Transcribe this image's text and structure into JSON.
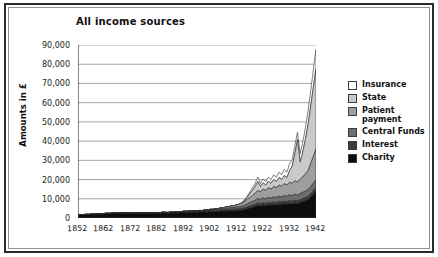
{
  "figure": {
    "title": "All income sources"
  },
  "legend": {
    "items": [
      {
        "label": "Insurance",
        "color": "#ffffff"
      },
      {
        "label": "State",
        "color": "#c9c9c9"
      },
      {
        "label": "Patient\npayment",
        "color": "#9e9e9e"
      },
      {
        "label": "Central Funds",
        "color": "#6e6e6e"
      },
      {
        "label": "Interest",
        "color": "#3d3d3d"
      },
      {
        "label": "Charity",
        "color": "#0d0d0d"
      }
    ]
  },
  "chart_data": {
    "type": "area",
    "stacked": true,
    "title": "All income sources",
    "xlabel": "",
    "ylabel": "Amounts in £",
    "xlim": [
      1852,
      1942
    ],
    "ylim": [
      0,
      90000
    ],
    "ytick_labels": [
      "90,000",
      "80,000",
      "70,000",
      "60,000",
      "50,000",
      "40,000",
      "30,000",
      "20,000",
      "10,000",
      "0"
    ],
    "ytick_values": [
      90000,
      80000,
      70000,
      60000,
      50000,
      40000,
      30000,
      20000,
      10000,
      0
    ],
    "xtick_labels": [
      "1852",
      "1862",
      "1872",
      "1882",
      "1892",
      "1902",
      "1912",
      "1922",
      "1932",
      "1942"
    ],
    "xtick_values": [
      1852,
      1862,
      1872,
      1882,
      1892,
      1902,
      1912,
      1922,
      1932,
      1942
    ],
    "grid": "horizontal",
    "legend_position": "right",
    "x": [
      1852,
      1853,
      1854,
      1855,
      1856,
      1857,
      1858,
      1859,
      1860,
      1861,
      1862,
      1863,
      1864,
      1865,
      1866,
      1867,
      1868,
      1869,
      1870,
      1871,
      1872,
      1873,
      1874,
      1875,
      1876,
      1877,
      1878,
      1879,
      1880,
      1881,
      1882,
      1883,
      1884,
      1885,
      1886,
      1887,
      1888,
      1889,
      1890,
      1891,
      1892,
      1893,
      1894,
      1895,
      1896,
      1897,
      1898,
      1899,
      1900,
      1901,
      1902,
      1903,
      1904,
      1905,
      1906,
      1907,
      1908,
      1909,
      1910,
      1911,
      1912,
      1913,
      1914,
      1915,
      1916,
      1917,
      1918,
      1919,
      1920,
      1921,
      1922,
      1923,
      1924,
      1925,
      1926,
      1927,
      1928,
      1929,
      1930,
      1931,
      1932,
      1933,
      1934,
      1935,
      1936,
      1937,
      1938,
      1939,
      1940,
      1941,
      1942
    ],
    "series": [
      {
        "name": "Charity",
        "color": "#0d0d0d",
        "values": [
          1500,
          1600,
          1550,
          1700,
          1650,
          1800,
          1750,
          1900,
          2000,
          1950,
          2100,
          2200,
          2150,
          2300,
          2250,
          2400,
          2350,
          2300,
          2400,
          2350,
          2300,
          2250,
          2400,
          2350,
          2300,
          2400,
          2350,
          2300,
          2450,
          2400,
          2500,
          2450,
          2600,
          2550,
          2500,
          2650,
          2600,
          2700,
          2650,
          2800,
          3000,
          2900,
          3000,
          2950,
          3100,
          3000,
          3200,
          3100,
          3300,
          3200,
          3400,
          3300,
          3500,
          3400,
          3600,
          3500,
          3800,
          3700,
          3900,
          3800,
          4000,
          3900,
          4200,
          4400,
          4800,
          5200,
          5600,
          6000,
          6600,
          6200,
          6800,
          6400,
          6900,
          6600,
          7000,
          6800,
          7200,
          7000,
          7400,
          7100,
          7600,
          7300,
          7800,
          7500,
          8000,
          8500,
          9000,
          9500,
          11000,
          12500,
          14000
        ]
      },
      {
        "name": "Interest",
        "color": "#3d3d3d",
        "values": [
          200,
          210,
          220,
          215,
          230,
          225,
          240,
          250,
          245,
          260,
          270,
          265,
          280,
          275,
          290,
          300,
          295,
          310,
          305,
          320,
          315,
          330,
          325,
          340,
          335,
          350,
          345,
          360,
          355,
          370,
          380,
          375,
          390,
          400,
          395,
          410,
          420,
          415,
          430,
          440,
          450,
          460,
          470,
          480,
          490,
          500,
          510,
          520,
          530,
          540,
          560,
          570,
          580,
          600,
          620,
          640,
          660,
          680,
          700,
          720,
          750,
          780,
          800,
          850,
          900,
          950,
          1000,
          1050,
          1100,
          1080,
          1150,
          1120,
          1200,
          1180,
          1250,
          1220,
          1300,
          1280,
          1350,
          1320,
          1400,
          1380,
          1450,
          1420,
          1500,
          1550,
          1600,
          1650,
          1700,
          1750,
          1800
        ]
      },
      {
        "name": "Central Funds",
        "color": "#6e6e6e",
        "values": [
          0,
          0,
          0,
          0,
          0,
          0,
          0,
          0,
          0,
          0,
          0,
          0,
          0,
          0,
          0,
          0,
          0,
          0,
          0,
          0,
          0,
          0,
          0,
          0,
          0,
          0,
          0,
          0,
          0,
          0,
          0,
          0,
          0,
          0,
          0,
          0,
          0,
          0,
          0,
          0,
          100,
          120,
          140,
          160,
          180,
          200,
          230,
          260,
          300,
          340,
          380,
          420,
          470,
          520,
          580,
          640,
          700,
          760,
          820,
          900,
          1000,
          1100,
          1200,
          1400,
          1600,
          1800,
          2000,
          2200,
          2400,
          2300,
          2500,
          2400,
          2600,
          2500,
          2700,
          2600,
          2800,
          2700,
          2900,
          2800,
          3000,
          2900,
          3100,
          3000,
          3200,
          3300,
          3400,
          3500,
          3600,
          3800,
          4000
        ]
      },
      {
        "name": "Patient payment",
        "color": "#9e9e9e",
        "values": [
          0,
          0,
          0,
          0,
          0,
          0,
          0,
          0,
          0,
          0,
          0,
          0,
          0,
          0,
          0,
          0,
          0,
          0,
          0,
          0,
          0,
          0,
          0,
          0,
          0,
          0,
          0,
          0,
          0,
          0,
          0,
          0,
          0,
          0,
          0,
          0,
          0,
          0,
          0,
          0,
          0,
          0,
          0,
          0,
          0,
          0,
          0,
          0,
          100,
          150,
          200,
          250,
          320,
          400,
          480,
          560,
          660,
          760,
          880,
          1000,
          1200,
          1400,
          1600,
          1900,
          2300,
          2700,
          3100,
          3600,
          4200,
          4000,
          4600,
          4400,
          5000,
          4800,
          5400,
          5200,
          5800,
          5600,
          6200,
          6000,
          6600,
          6400,
          7000,
          6800,
          7400,
          8000,
          9000,
          10000,
          12000,
          14000,
          16000
        ]
      },
      {
        "name": "State",
        "color": "#c9c9c9",
        "values": [
          0,
          0,
          0,
          0,
          0,
          0,
          0,
          0,
          0,
          0,
          0,
          0,
          0,
          0,
          0,
          0,
          0,
          0,
          0,
          0,
          0,
          0,
          0,
          0,
          0,
          0,
          0,
          0,
          0,
          0,
          0,
          0,
          0,
          0,
          0,
          0,
          0,
          0,
          0,
          0,
          0,
          0,
          0,
          0,
          0,
          0,
          0,
          0,
          0,
          0,
          0,
          0,
          0,
          0,
          0,
          0,
          0,
          0,
          0,
          0,
          0,
          0,
          200,
          600,
          1200,
          2000,
          2800,
          3600,
          4600,
          2800,
          3200,
          2800,
          3400,
          3000,
          3600,
          3200,
          3900,
          3500,
          4200,
          3800,
          6000,
          9000,
          14000,
          22000,
          9000,
          13000,
          18000,
          24000,
          30000,
          36000,
          42000
        ]
      },
      {
        "name": "Insurance",
        "color": "#ffffff",
        "values": [
          0,
          0,
          0,
          0,
          0,
          0,
          0,
          0,
          0,
          0,
          0,
          0,
          0,
          0,
          0,
          0,
          0,
          0,
          0,
          0,
          0,
          0,
          0,
          0,
          0,
          0,
          0,
          0,
          0,
          0,
          0,
          0,
          0,
          0,
          0,
          0,
          0,
          0,
          0,
          0,
          0,
          0,
          0,
          0,
          0,
          0,
          0,
          0,
          0,
          0,
          0,
          0,
          0,
          0,
          0,
          0,
          0,
          0,
          0,
          0,
          0,
          0,
          100,
          300,
          600,
          900,
          1300,
          1700,
          2400,
          1500,
          2000,
          1700,
          2200,
          1900,
          2500,
          2200,
          2800,
          2500,
          3200,
          2900,
          3600,
          3300,
          4200,
          3800,
          4500,
          5000,
          6000,
          7000,
          8000,
          9000,
          10000
        ]
      }
    ]
  }
}
